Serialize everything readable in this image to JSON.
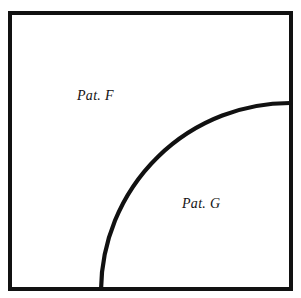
{
  "figure": {
    "type": "region-diagram",
    "background_color": "#ffffff",
    "stroke_color": "#111111",
    "canvas": {
      "width": 301,
      "height": 298
    },
    "boundary": {
      "shape": "rectangle",
      "x": 10,
      "y": 13,
      "width": 281,
      "height": 276,
      "stroke_width": 4
    },
    "divider": {
      "shape": "quarter-circle-arc",
      "center_x": 292,
      "center_y": 290,
      "radius": 189,
      "start_point_x": 101,
      "start_point_y": 290,
      "end_point_x": 292,
      "end_point_y": 103,
      "stroke_width": 4
    },
    "labels": [
      {
        "id": "pat-f",
        "text": "Pat. F",
        "x": 77,
        "y": 89
      },
      {
        "id": "pat-g",
        "text": "Pat. G",
        "x": 182,
        "y": 197
      }
    ]
  }
}
